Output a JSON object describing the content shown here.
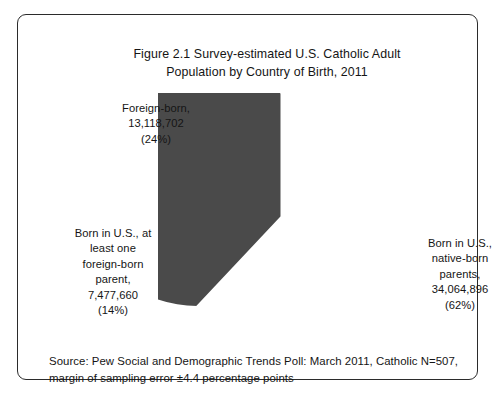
{
  "figure": {
    "title_line1": "Figure 2.1 Survey-estimated U.S. Catholic Adult",
    "title_line2": "Population by Country of Birth, 2011",
    "source_line1": "Source: Pew Social and Demographic Trends Poll: March 2011, Catholic N=507,",
    "source_line2": "margin of sampling error ±4.4 percentage points"
  },
  "labels": {
    "foreign_born": {
      "line1": "Foreign-born,",
      "line2": "13,118,702",
      "line3": "(24%)"
    },
    "one_foreign_parent": {
      "line1": "Born in U.S., at",
      "line2": "least one",
      "line3": "foreign-born",
      "line4": "parent,",
      "line5": "7,477,660",
      "line6": "(14%)"
    },
    "native_born": {
      "line1": "Born in U.S.,",
      "line2": "native-born",
      "line3": "parents,",
      "line4": "34,064,896",
      "line5": "(62%)"
    }
  },
  "chart_data": {
    "type": "pie",
    "title": "Figure 2.1 Survey-estimated U.S. Catholic Adult Population by Country of Birth, 2011",
    "subtitle": "",
    "xlabel": "",
    "ylabel": "",
    "grid": false,
    "legend_position": "none (direct slice labels)",
    "start_angle_deg": 90,
    "direction": "counterclockwise",
    "categories": [
      "Foreign-born",
      "Born in U.S., at least one foreign-born parent",
      "Born in U.S., native-born parents"
    ],
    "values": [
      13118702,
      7477660,
      34064896
    ],
    "percentages": [
      24,
      14,
      62
    ],
    "colors": [
      "#757575",
      "#bdbdbd",
      "#4a4a4a"
    ],
    "slice_border_color": "#ffffff",
    "total": 54661258,
    "annotations": [
      "Foreign-born, 13,118,702 (24%)",
      "Born in U.S., at least one foreign-born parent, 7,477,660 (14%)",
      "Born in U.S., native-born parents, 34,064,896 (62%)"
    ],
    "source": "Pew Social and Demographic Trends Poll: March 2011, Catholic N=507, margin of sampling error ±4.4 percentage points"
  }
}
